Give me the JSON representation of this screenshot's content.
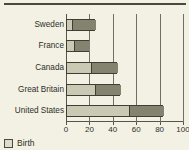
{
  "chart_data": {
    "type": "bar",
    "orientation": "horizontal",
    "stacked": true,
    "title": "",
    "xlabel": "",
    "ylabel": "",
    "categories": [
      "Sweden",
      "France",
      "Canada",
      "Great Britain",
      "United States"
    ],
    "series": [
      {
        "name": "Birth",
        "values": [
          5,
          7,
          21,
          25,
          54
        ]
      },
      {
        "name": "",
        "values": [
          20,
          13,
          23,
          21,
          29
        ]
      }
    ],
    "totals": [
      25,
      20,
      44,
      46,
      83
    ],
    "xlim": [
      0,
      100
    ],
    "xticks": [
      0,
      20,
      40,
      60,
      80,
      100
    ],
    "xtick_labels": [
      "0",
      "20",
      "40",
      "60",
      "80",
      "100"
    ],
    "grid": true,
    "grid_axis": "x",
    "legend_position": "bottom-left"
  },
  "legend": {
    "entries": [
      {
        "label": "Birth",
        "swatch": "legend-swatch-birth",
        "color": "#ddddcc"
      }
    ]
  },
  "colors": {
    "background": "#f2f1e4",
    "birth": "#c9c9b4",
    "other": "#83836f",
    "axis": "#55554a",
    "grid": "#6f6f62",
    "text": "#2f2f28",
    "rule": "#4a4a3c"
  }
}
